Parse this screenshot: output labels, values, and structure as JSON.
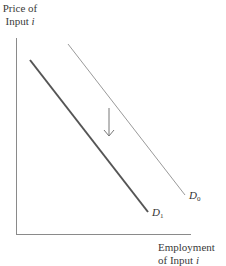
{
  "y_axis": {
    "label_line1": "Price of",
    "label_line2_text": "Input ",
    "label_line2_var": "i"
  },
  "x_axis": {
    "label_line1": "Employment",
    "label_line2_text": "of Input ",
    "label_line2_var": "i"
  },
  "curves": [
    {
      "name": "D",
      "subscript": "0",
      "color": "#9a9a9a",
      "stroke_width": 1,
      "from": [
        68,
        44
      ],
      "to": [
        185,
        195
      ]
    },
    {
      "name": "D",
      "subscript": "1",
      "color": "#555555",
      "stroke_width": 2,
      "from": [
        30,
        60
      ],
      "to": [
        148,
        212
      ]
    }
  ],
  "arrow": {
    "direction": "down",
    "color": "#777777",
    "x": 109,
    "y_start": 108,
    "y_end": 136
  }
}
